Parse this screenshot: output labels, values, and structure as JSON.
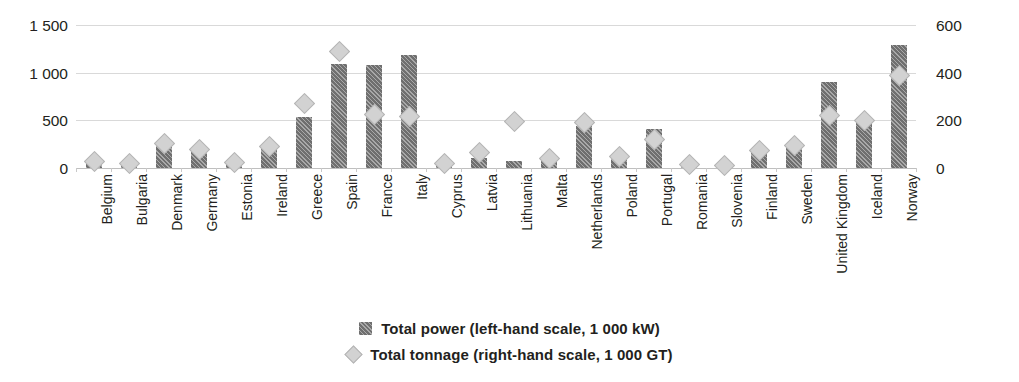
{
  "chart_data": {
    "type": "bar",
    "title": "",
    "subtitle": "",
    "xlabel": "",
    "ylabel": "",
    "categories": [
      "Belgium",
      "Bulgaria",
      "Denmark",
      "Germany",
      "Estonia",
      "Ireland",
      "Greece",
      "Spain",
      "France",
      "Italy",
      "Cyprus",
      "Latvia",
      "Lithuania",
      "Malta",
      "Netherlands",
      "Poland",
      "Portugal",
      "Romania",
      "Slovenia",
      "Finland",
      "Sweden",
      "United Kingdom",
      "Iceland",
      "Norway"
    ],
    "series": [
      {
        "name": "Total power (left-hand scale, 1 000 kW)",
        "type": "bar",
        "axis": "left",
        "color": "#6f6f6f",
        "pattern": "diagonal-hatch",
        "values": [
          55,
          30,
          255,
          175,
          50,
          205,
          535,
          1090,
          1085,
          1185,
          20,
          100,
          70,
          85,
          440,
          110,
          405,
          15,
          10,
          175,
          215,
          900,
          525,
          1290
        ]
      },
      {
        "name": "Total tonnage (right-hand scale, 1 000 GT)",
        "type": "marker",
        "marker": "diamond",
        "axis": "right",
        "color": "#d2d2d2",
        "values": [
          25,
          15,
          100,
          75,
          20,
          85,
          265,
          485,
          220,
          210,
          15,
          60,
          190,
          35,
          185,
          45,
          115,
          10,
          5,
          70,
          90,
          215,
          195,
          385
        ]
      }
    ],
    "axes": {
      "left": {
        "ticks": [
          "0",
          "500",
          "1 000",
          "1 500"
        ],
        "tick_values": [
          0,
          500,
          1000,
          1500
        ],
        "min": 0,
        "max": 1500,
        "unit": "1 000 kW"
      },
      "right": {
        "ticks": [
          "0",
          "200",
          "400",
          "600"
        ],
        "tick_values": [
          0,
          200,
          400,
          600
        ],
        "min": 0,
        "max": 600,
        "unit": "1 000 GT"
      }
    },
    "grid": true,
    "legend_position": "bottom"
  },
  "legend": {
    "entries": [
      {
        "label": "Total power (left-hand scale, 1 000 kW)",
        "icon": "hatched-square-swatch"
      },
      {
        "label": "Total tonnage (right-hand scale, 1 000 GT)",
        "icon": "diamond-swatch"
      }
    ]
  }
}
